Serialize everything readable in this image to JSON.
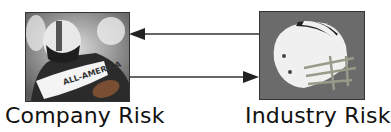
{
  "diagram": {
    "nodes": [
      {
        "id": "company",
        "label": "Company Risk",
        "image": "football-player-photo"
      },
      {
        "id": "industry",
        "label": "Industry Risk",
        "image": "football-helmet-photo"
      }
    ],
    "edges": [
      {
        "from": "industry",
        "to": "company",
        "direction": "left"
      },
      {
        "from": "company",
        "to": "industry",
        "direction": "right"
      }
    ],
    "colors": {
      "arrow": "#333333",
      "text": "#111111",
      "border": "#333333"
    }
  }
}
